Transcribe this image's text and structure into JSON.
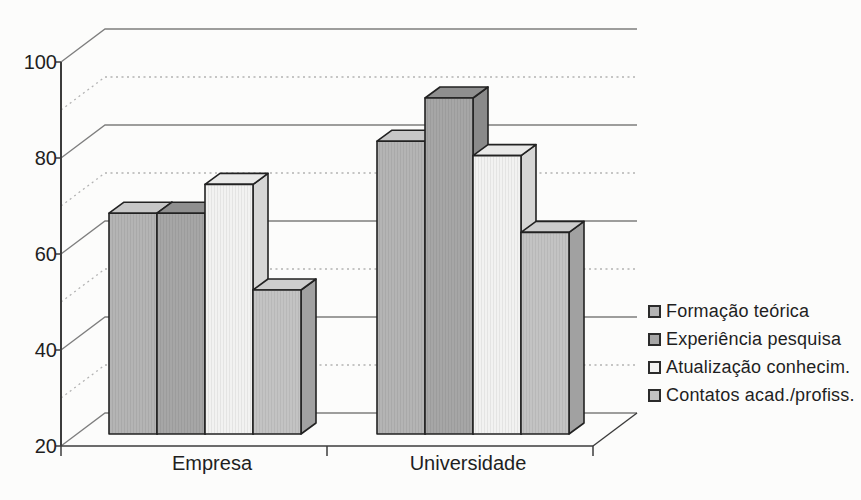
{
  "chart_data": {
    "type": "bar",
    "variant": "3d-column",
    "title": "",
    "xlabel": "",
    "ylabel": "",
    "categories": [
      "Empresa",
      "Universidade"
    ],
    "series": [
      {
        "name": "Formação teórica",
        "values": [
          66,
          81
        ],
        "color_front": "#b4b4b4",
        "color_top": "#c7c7c7",
        "color_side": "#979797"
      },
      {
        "name": "Experiência pesquisa",
        "values": [
          66,
          90
        ],
        "color_front": "#a6a6a6",
        "color_top": "#8f8f8f",
        "color_side": "#8a8a8a"
      },
      {
        "name": "Atualização conhecim.",
        "values": [
          72,
          78
        ],
        "color_front": "#f2f2f1",
        "color_top": "#e9e9e8",
        "color_side": "#d6d6d5"
      },
      {
        "name": "Contatos acad./profiss.",
        "values": [
          50,
          62
        ],
        "color_front": "#c3c3c3",
        "color_top": "#cdcdcd",
        "color_side": "#a1a1a1"
      }
    ],
    "ylim": [
      20,
      100
    ],
    "yticks": [
      20,
      40,
      60,
      80,
      100
    ],
    "ytick_labels": [
      "20",
      "40",
      "60",
      "80",
      "100"
    ],
    "minor_ticks": [
      30,
      50,
      70,
      90
    ],
    "grid": "major-solid, minor-dotted, back-wall",
    "legend_position": "right"
  },
  "colors": {
    "background": "#fcfcfb",
    "grid_major": "#7e7e7e",
    "grid_minor": "#b3b3b3",
    "axis": "#3c3c3c",
    "bar_outline": "#222222",
    "text": "#1f1f1f"
  }
}
